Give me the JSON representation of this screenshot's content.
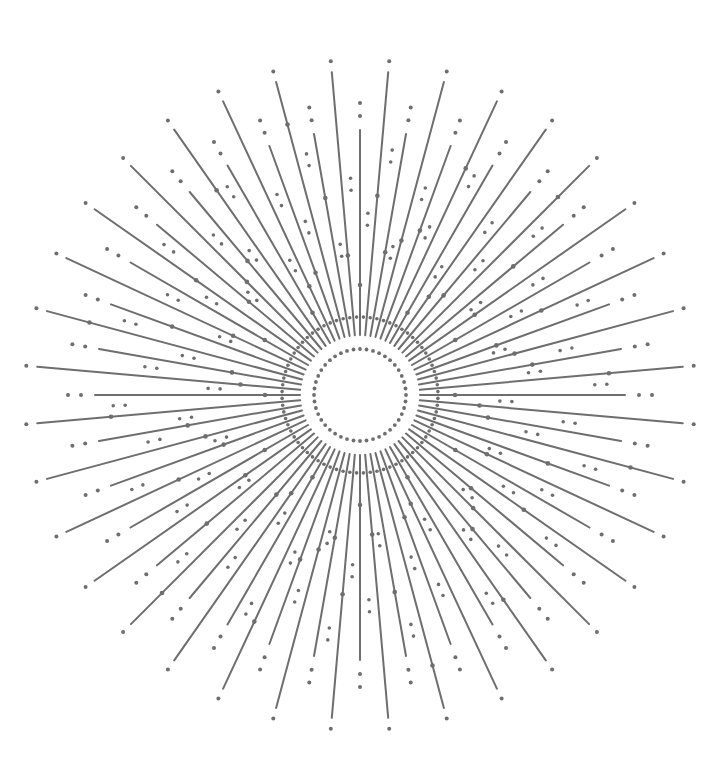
{
  "canvas": {
    "width": 718,
    "height": 774,
    "background": "#ffffff"
  },
  "starburst": {
    "center": {
      "x": 360,
      "y": 395
    },
    "color": "#6e6e6e",
    "ray_stroke_width": 2,
    "dot_radius": 2,
    "angle_step_deg": 10,
    "inner_ring": {
      "radius": 46,
      "dot_count": 44,
      "dot_radius": 1.9
    },
    "long_rays": {
      "count": 36,
      "angle_offset_deg": 5,
      "inner_radius": 60,
      "outer_radius": 324,
      "tip_dot_radius": 335,
      "bead_radii_cycle": [
        200,
        160,
        250,
        120,
        280,
        140
      ]
    },
    "short_rays": {
      "count": 36,
      "angle_offset_deg": 0,
      "inner_radius": 60,
      "outer_radius": 265,
      "tip_dot_radii": [
        279,
        292
      ],
      "bead_radii_cycle": [
        110,
        145,
        175,
        95,
        130,
        200
      ]
    },
    "between_dots": {
      "angle_offset_deg": 2.5,
      "radii_cycle": [
        [
          78,
          170,
          182
        ],
        [
          78,
          235,
          247
        ],
        [
          78,
          140,
          152
        ],
        [
          78,
          205,
          217
        ]
      ]
    }
  }
}
